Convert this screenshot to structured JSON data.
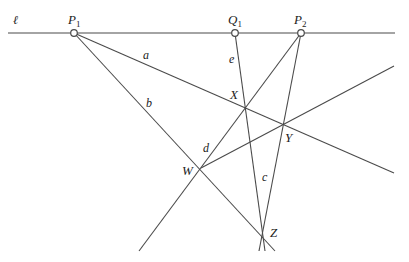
{
  "diagram": {
    "type": "projective-geometry-construction",
    "line_l": {
      "label": "ℓ",
      "from": [
        8,
        33
      ],
      "to": [
        395,
        33
      ]
    },
    "points_on_l": [
      {
        "name": "P1",
        "label": "P",
        "sub": "1",
        "x": 74,
        "y": 33,
        "label_x": 68,
        "label_y": 22
      },
      {
        "name": "Q1",
        "label": "Q",
        "sub": "1",
        "x": 235,
        "y": 33,
        "label_x": 228,
        "label_y": 22
      },
      {
        "name": "P2",
        "label": "P",
        "sub": "2",
        "x": 301,
        "y": 33,
        "label_x": 295,
        "label_y": 22
      }
    ],
    "intersection_points": [
      {
        "name": "X",
        "label": "X",
        "x": 246,
        "y": 106,
        "label_x": 230,
        "label_y": 100
      },
      {
        "name": "Y",
        "label": "Y",
        "x": 284,
        "y": 124,
        "label_x": 286,
        "label_y": 142
      },
      {
        "name": "W",
        "label": "W",
        "x": 201,
        "y": 168,
        "label_x": 183,
        "label_y": 175
      },
      {
        "name": "Z",
        "label": "Z",
        "x": 263,
        "y": 233,
        "label_x": 270,
        "label_y": 238
      }
    ],
    "lines": [
      {
        "name": "a",
        "label": "a",
        "from": [
          74,
          33
        ],
        "to": [
          394,
          173
        ],
        "label_x": 143,
        "label_y": 58
      },
      {
        "name": "b",
        "label": "b",
        "from": [
          74,
          33
        ],
        "to": [
          275,
          251
        ],
        "label_x": 146,
        "label_y": 106
      },
      {
        "name": "e",
        "label": "e",
        "from": [
          235,
          33
        ],
        "to": [
          265,
          251
        ],
        "label_x": 229,
        "label_y": 62
      },
      {
        "name": "c",
        "label": "c",
        "from": [
          301,
          33
        ],
        "to": [
          259,
          251
        ],
        "label_x": 262,
        "label_y": 181
      },
      {
        "name": "d",
        "label": "d",
        "from": [
          301,
          33
        ],
        "to": [
          139,
          251
        ],
        "label_x": 204,
        "label_y": 151
      },
      {
        "name": "WY",
        "label": "",
        "from": [
          201,
          168
        ],
        "to": [
          394,
          66
        ]
      }
    ],
    "labels": {
      "l": "ℓ",
      "P1": "P",
      "P1_sub": "1",
      "Q1": "Q",
      "Q1_sub": "1",
      "P2": "P",
      "P2_sub": "2",
      "X": "X",
      "Y": "Y",
      "W": "W",
      "Z": "Z",
      "a": "a",
      "b": "b",
      "c": "c",
      "d": "d",
      "e": "e"
    },
    "colors": {
      "line": "#4a4a4a",
      "text": "#222222",
      "background": "#ffffff"
    }
  }
}
